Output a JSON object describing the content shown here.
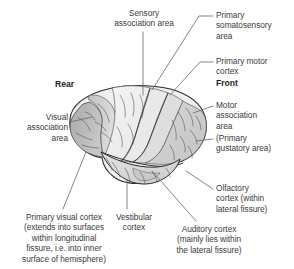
{
  "diagram": {
    "view": "left lateral hemisphere",
    "orientation": {
      "rear_label": "Rear",
      "front_label": "Front"
    },
    "colors": {
      "text": "#3b3b3b",
      "bold_text": "#1d1d1d",
      "leader_line": "#6f6f6f",
      "outline": "#2b2b2b",
      "brain_light": "#f0f0f0",
      "brain_mid": "#dcdcdc",
      "brain_dark": "#b4b4b4",
      "background": "#ffffff"
    },
    "labels": [
      {
        "id": "sensory-association-area",
        "text": "Sensory\nassociation area",
        "align": "center"
      },
      {
        "id": "primary-somatosensory-area",
        "text": "Primary\nsomatosensory\narea",
        "align": "left"
      },
      {
        "id": "primary-motor-cortex",
        "text": "Primary motor\ncortex",
        "align": "left"
      },
      {
        "id": "front",
        "text": "Front",
        "align": "left",
        "bold": true
      },
      {
        "id": "rear",
        "text": "Rear",
        "align": "left",
        "bold": true
      },
      {
        "id": "motor-association-area",
        "text": "Motor\nassociation\narea",
        "align": "left"
      },
      {
        "id": "primary-gustatory-area",
        "text": "(Primary\ngustatory area)",
        "align": "left"
      },
      {
        "id": "visual-association-area",
        "text": "Visual\nassociation\narea",
        "align": "right"
      },
      {
        "id": "olfactory-cortex",
        "text": "Olfactory\ncortex (within\nlateral fissure)",
        "align": "left"
      },
      {
        "id": "primary-visual-cortex",
        "text": "Primary visual cortex\n(extends into surfaces\nwithin longitudinal\nfissure, i.e. into inner\nsurface of hemisphere)",
        "align": "center"
      },
      {
        "id": "vestibular-cortex",
        "text": "Vestibular\ncortex",
        "align": "center"
      },
      {
        "id": "auditory-cortex",
        "text": "Auditory cortex\n(mainly lies within\nthe lateral fissure)",
        "align": "center"
      }
    ]
  }
}
